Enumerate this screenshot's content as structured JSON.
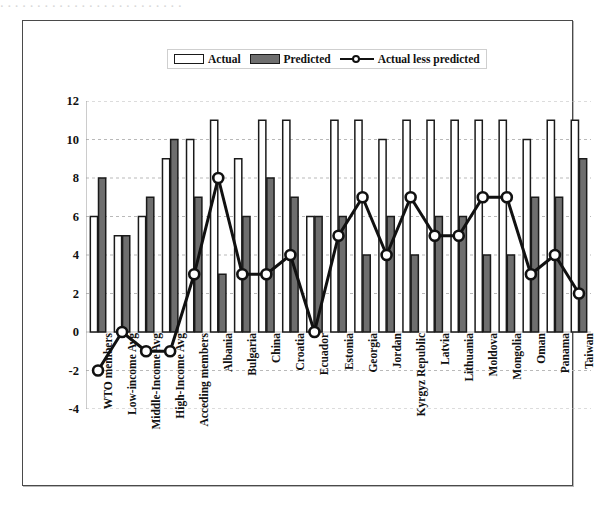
{
  "top_fragment": "· · · · · · · · · · · · · · · · · · · · · · · · ·",
  "legend": {
    "items": [
      {
        "label": "Actual",
        "swatch": "hollow-bar-swatch"
      },
      {
        "label": "Predicted",
        "swatch": "filled-bar-swatch"
      },
      {
        "label": "Actual less predicted",
        "swatch": "line-marker-swatch"
      }
    ]
  },
  "chart_data": {
    "type": "bar",
    "title": "",
    "subtitle": "",
    "xlabel": "",
    "ylabel": "",
    "ylim": [
      -4,
      12
    ],
    "yticks": [
      -4,
      -2,
      0,
      2,
      4,
      6,
      8,
      10,
      12
    ],
    "ytick_labels": [
      "-4",
      "-2",
      "0",
      "2",
      "4",
      "6",
      "8",
      "10",
      "12"
    ],
    "grid": true,
    "grid_axis": "y",
    "legend_position": "top-center",
    "categories": [
      "WTO members",
      "Low-income Avg",
      "Middle-Income Avg",
      "High-Income Avg",
      "Acceding members",
      "Albania",
      "Bulgaria",
      "China",
      "Croatia",
      "Ecuador",
      "Estonia",
      "Georgia",
      "Jordan",
      "Kyrgyz Republic",
      "Latvia",
      "Lithuania",
      "Moldova",
      "Mongolia",
      "Oman",
      "Panama",
      "Taiwan"
    ],
    "series": [
      {
        "name": "Actual",
        "kind": "bar",
        "color": "#ffffff",
        "edge_color": "#1a1a1a",
        "values": [
          6,
          5,
          6,
          9,
          10,
          11,
          9,
          11,
          11,
          6,
          11,
          11,
          10,
          11,
          11,
          11,
          11,
          11,
          10,
          11,
          11
        ]
      },
      {
        "name": "Predicted",
        "kind": "bar",
        "color": "#6e6e6e",
        "edge_color": "#1a1a1a",
        "values": [
          8,
          5,
          7,
          10,
          7,
          3,
          6,
          8,
          7,
          6,
          6,
          4,
          6,
          4,
          6,
          6,
          4,
          4,
          7,
          7,
          9
        ]
      },
      {
        "name": "Actual less predicted",
        "kind": "line",
        "color": "#111111",
        "marker": "circle-open",
        "values": [
          -2,
          0,
          -1,
          -1,
          3,
          8,
          3,
          3,
          4,
          0,
          5,
          7,
          4,
          7,
          5,
          5,
          7,
          7,
          3,
          4,
          2
        ]
      }
    ]
  }
}
